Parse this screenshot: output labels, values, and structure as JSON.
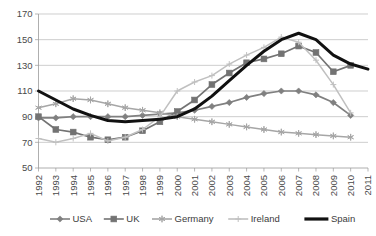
{
  "chart_data": {
    "type": "line",
    "title": "",
    "subtitle": "",
    "xlabel": "",
    "ylabel": "",
    "grid": "horizontal",
    "legend_position": "bottom",
    "xlim": [
      1992,
      2011
    ],
    "ylim": [
      50,
      170
    ],
    "ytick_step": 20,
    "x": [
      1992,
      1993,
      1994,
      1995,
      1996,
      1997,
      1998,
      1999,
      2000,
      2001,
      2002,
      2003,
      2004,
      2005,
      2006,
      2007,
      2008,
      2009,
      2010,
      2011
    ],
    "categories": [
      "1992",
      "1993",
      "1994",
      "1995",
      "1996",
      "1997",
      "1998",
      "1999",
      "2000",
      "2001",
      "2002",
      "2003",
      "2004",
      "2005",
      "2006",
      "2007",
      "2008",
      "2009",
      "2010",
      "2011"
    ],
    "yticks": [
      "50",
      "70",
      "90",
      "110",
      "130",
      "150",
      "170"
    ],
    "series": [
      {
        "name": "USA",
        "marker": "diamond",
        "color": "#808080",
        "values": [
          89,
          89,
          90,
          90,
          90,
          90,
          91,
          92,
          93,
          95,
          98,
          101,
          105,
          108,
          110,
          110,
          107,
          101,
          91,
          null
        ]
      },
      {
        "name": "UK",
        "marker": "square",
        "color": "#737373",
        "values": [
          90,
          80,
          78,
          74,
          72,
          74,
          79,
          86,
          94,
          103,
          115,
          124,
          132,
          135,
          139,
          145,
          140,
          125,
          130,
          null
        ]
      },
      {
        "name": "Germany",
        "marker": "asterisk",
        "color": "#a6a6a6",
        "values": [
          97,
          100,
          104,
          103,
          100,
          97,
          95,
          93,
          90,
          88,
          86,
          84,
          82,
          80,
          78,
          77,
          76,
          75,
          74,
          null
        ]
      },
      {
        "name": "Ireland",
        "marker": "plus",
        "color": "#c0c0c0",
        "values": [
          73,
          70,
          73,
          77,
          71,
          74,
          80,
          90,
          110,
          117,
          122,
          131,
          138,
          144,
          152,
          148,
          134,
          115,
          93,
          null
        ]
      },
      {
        "name": "Spain",
        "marker": "none",
        "color": "#111111",
        "values": [
          110,
          103,
          96,
          91,
          87,
          86,
          87,
          88,
          90,
          96,
          106,
          118,
          130,
          141,
          150,
          155,
          150,
          138,
          131,
          127
        ]
      }
    ]
  },
  "legend": {
    "items": [
      {
        "label": "USA"
      },
      {
        "label": "UK"
      },
      {
        "label": "Germany"
      },
      {
        "label": "Ireland"
      },
      {
        "label": "Spain"
      }
    ]
  }
}
